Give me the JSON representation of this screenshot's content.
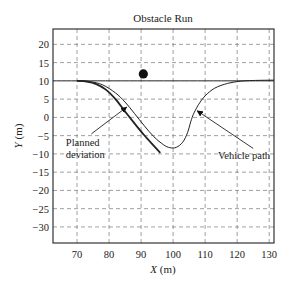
{
  "chart_data": {
    "type": "line",
    "title": "Obstacle Run",
    "xlabel": "X (m)",
    "ylabel": "Y (m)",
    "xlabel_var": "X",
    "xlabel_unit": " (m)",
    "ylabel_var": "Y",
    "ylabel_unit": " (m)",
    "xlim": [
      62.5,
      131.5
    ],
    "ylim": [
      -34.4,
      24.2
    ],
    "xticks": [
      70,
      80,
      90,
      100,
      110,
      120,
      130
    ],
    "yticks": [
      20,
      15,
      10,
      5,
      0,
      -5,
      -10,
      -15,
      -20,
      -25,
      -30
    ],
    "grid": true,
    "grid_style": "dashed",
    "legend": null,
    "series": [
      {
        "name": "Reference line",
        "style": "solid-thin",
        "x": [
          62.5,
          131.5
        ],
        "y": [
          10,
          10
        ]
      },
      {
        "name": "Planned deviation",
        "style": "solid-thick",
        "x": [
          70,
          73,
          76,
          79,
          82,
          85,
          88,
          91,
          94,
          96
        ],
        "y": [
          10,
          9.8,
          9.1,
          7.6,
          5.0,
          1.6,
          -1.7,
          -4.9,
          -7.8,
          -9.7
        ]
      },
      {
        "name": "Vehicle path",
        "style": "solid-thin",
        "x": [
          70,
          74,
          78,
          82,
          85,
          88,
          91,
          94,
          97,
          99,
          101,
          103,
          104.5,
          105.5,
          106.3,
          107,
          108,
          110,
          113,
          117,
          121,
          125,
          131.5
        ],
        "y": [
          10,
          9.8,
          8.9,
          6.7,
          4.2,
          1.0,
          -2.3,
          -5.3,
          -7.5,
          -8.3,
          -8.2,
          -6.8,
          -4.2,
          -1.2,
          0.8,
          2.0,
          3.6,
          5.9,
          8.0,
          9.3,
          9.9,
          10.1,
          10.2
        ]
      }
    ],
    "markers": [
      {
        "name": "Obstacle",
        "shape": "filled-circle",
        "x": 90.7,
        "y": 11.9
      }
    ],
    "annotations": [
      {
        "text_lines": [
          "Planned",
          "deviation"
        ],
        "text_x": 66.5,
        "text_y": -7.8,
        "arrow_from": [
          74.5,
          -4.5
        ],
        "arrow_to": [
          85.5,
          2.8
        ]
      },
      {
        "text_lines": [
          "Vehicle path"
        ],
        "text_x": 114,
        "text_y": -11.5,
        "arrow_from": [
          125,
          -8.5
        ],
        "arrow_to": [
          107.5,
          1.8
        ]
      }
    ]
  },
  "labels": {
    "title": "Obstacle Run"
  }
}
